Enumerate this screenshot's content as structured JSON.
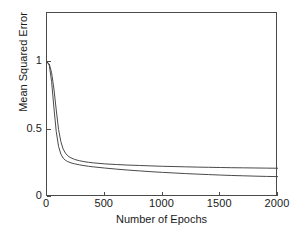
{
  "chart_data": {
    "type": "line",
    "title": "",
    "xlabel": "Number of Epochs",
    "ylabel": "Mean Squared Error",
    "xlim": [
      0,
      2000
    ],
    "ylim": [
      0,
      1.363
    ],
    "xticks": [
      0,
      500,
      1000,
      1500,
      2000
    ],
    "xtick_labels": [
      "0",
      "500",
      "1000",
      "1500",
      "2000"
    ],
    "yticks": [
      0,
      0.5,
      1
    ],
    "ytick_labels": [
      "0",
      "0.5",
      "1"
    ],
    "grid": false,
    "legend": "none",
    "line_color": "#4a4a4a",
    "background_color": "#ffffff",
    "x": [
      0,
      20,
      40,
      60,
      80,
      100,
      120,
      140,
      160,
      180,
      200,
      240,
      280,
      320,
      360,
      400,
      500,
      600,
      700,
      800,
      900,
      1000,
      1100,
      1200,
      1300,
      1400,
      1500,
      1600,
      1700,
      1800,
      1900,
      2000
    ],
    "series": [
      {
        "name": "curve-1",
        "values": [
          1.0,
          0.985,
          0.92,
          0.8,
          0.645,
          0.5,
          0.41,
          0.355,
          0.325,
          0.305,
          0.293,
          0.278,
          0.269,
          0.262,
          0.257,
          0.253,
          0.2455,
          0.2405,
          0.2365,
          0.2335,
          0.2305,
          0.2275,
          0.2255,
          0.2235,
          0.2215,
          0.22,
          0.2185,
          0.217,
          0.216,
          0.215,
          0.214,
          0.213
        ]
      },
      {
        "name": "curve-2",
        "values": [
          1.0,
          0.975,
          0.855,
          0.66,
          0.485,
          0.375,
          0.318,
          0.288,
          0.272,
          0.262,
          0.255,
          0.2455,
          0.2385,
          0.2325,
          0.2275,
          0.2235,
          0.2145,
          0.2065,
          0.1995,
          0.1935,
          0.1875,
          0.1825,
          0.178,
          0.1735,
          0.1695,
          0.166,
          0.1625,
          0.1595,
          0.157,
          0.1545,
          0.1525,
          0.151
        ]
      }
    ]
  },
  "axes": {
    "xlabel": "Number of Epochs",
    "ylabel": "Mean Squared Error"
  }
}
